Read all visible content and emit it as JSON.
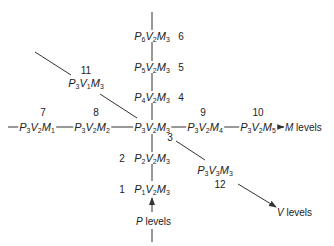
{
  "diagram": {
    "type": "factor-level network",
    "center": {
      "id": "c",
      "P": "3",
      "V": "2",
      "M": "3",
      "x": 152,
      "y": 127
    },
    "nodes": [
      {
        "id": "n6",
        "number": "6",
        "P": "6",
        "V": "2",
        "M": "3",
        "x": 152,
        "y": 36,
        "num_x": 181,
        "num_y": 36
      },
      {
        "id": "n5",
        "number": "5",
        "P": "5",
        "V": "2",
        "M": "3",
        "x": 152,
        "y": 67,
        "num_x": 181,
        "num_y": 67
      },
      {
        "id": "n4",
        "number": "4",
        "P": "4",
        "V": "2",
        "M": "3",
        "x": 152,
        "y": 97,
        "num_x": 181,
        "num_y": 97
      },
      {
        "id": "n7",
        "number": "7",
        "P": "3",
        "V": "2",
        "M": "1",
        "x": 37,
        "y": 127,
        "num_x": 43,
        "num_y": 112
      },
      {
        "id": "n8",
        "number": "8",
        "P": "3",
        "V": "2",
        "M": "2",
        "x": 92,
        "y": 127,
        "num_x": 96,
        "num_y": 112
      },
      {
        "id": "n9",
        "number": "9",
        "P": "3",
        "V": "2",
        "M": "4",
        "x": 205,
        "y": 127,
        "num_x": 203,
        "num_y": 112
      },
      {
        "id": "n10",
        "number": "10",
        "P": "3",
        "V": "2",
        "M": "5",
        "x": 258,
        "y": 127,
        "num_x": 258,
        "num_y": 112
      },
      {
        "id": "n2",
        "number": "2",
        "P": "2",
        "V": "2",
        "M": "3",
        "x": 152,
        "y": 158,
        "num_x": 122,
        "num_y": 158
      },
      {
        "id": "n1",
        "number": "1",
        "P": "1",
        "V": "2",
        "M": "3",
        "x": 152,
        "y": 189,
        "num_x": 122,
        "num_y": 189
      },
      {
        "id": "n11",
        "number": "11",
        "P": "3",
        "V": "1",
        "M": "3",
        "x": 86,
        "y": 83,
        "num_x": 86,
        "num_y": 70
      },
      {
        "id": "n3",
        "number": "3",
        "P": "3",
        "V": "3",
        "M": "3",
        "x": 215,
        "y": 170,
        "num_x": 170,
        "num_y": 137
      },
      {
        "id": "n12",
        "number": "12",
        "P": "",
        "V": "",
        "M": "",
        "x": 0,
        "y": 0,
        "num_x": 220,
        "num_y": 184
      }
    ],
    "axis_labels": {
      "m_levels": {
        "prefix": "M",
        "text": " levels",
        "x": 283,
        "y": 127
      },
      "p_levels": {
        "prefix": "P",
        "text": " levels",
        "x": 136,
        "y": 221
      },
      "v_levels": {
        "prefix": "V",
        "text": " levels",
        "x": 277,
        "y": 212
      }
    },
    "colors": {
      "line": "#333333",
      "text": "#222222",
      "background": "#ffffff"
    }
  }
}
